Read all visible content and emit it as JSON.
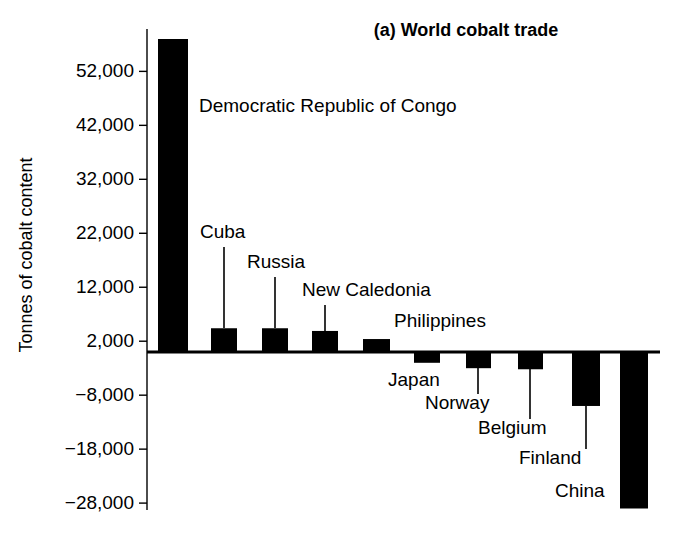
{
  "chart_data": {
    "type": "bar",
    "title": "(a) World cobalt trade",
    "xlabel": "",
    "ylabel": "Tonnes of cobalt content",
    "categories": [
      "Democratic Republic of Congo",
      "Cuba",
      "Russia",
      "New Caledonia",
      "Philippines",
      "Japan",
      "Norway",
      "Belgium",
      "Finland",
      "China"
    ],
    "values": [
      58000,
      4400,
      4400,
      3900,
      2400,
      -2000,
      -3000,
      -3200,
      -10000,
      -29000
    ],
    "ylim": [
      -28000,
      52000
    ],
    "ytick_values": [
      52000,
      42000,
      32000,
      22000,
      12000,
      2000,
      -8000,
      -18000,
      -28000
    ],
    "ytick_labels": [
      "52,000",
      "42,000",
      "32,000",
      "22,000",
      "12,000",
      "2,000",
      "−8,000",
      "−18,000",
      "−28,000"
    ],
    "grid": false,
    "legend": null,
    "bar_color": "#000000",
    "background_color": "#ffffff",
    "annotations": [
      {
        "text": "Democratic Republic of Congo",
        "category": "Democratic Republic of Congo",
        "leader": false
      },
      {
        "text": "Cuba",
        "category": "Cuba",
        "leader": true
      },
      {
        "text": "Russia",
        "category": "Russia",
        "leader": true
      },
      {
        "text": "New Caledonia",
        "category": "New Caledonia",
        "leader": true
      },
      {
        "text": "Philippines",
        "category": "Philippines",
        "leader": true
      },
      {
        "text": "Japan",
        "category": "Japan",
        "leader": false
      },
      {
        "text": "Norway",
        "category": "Norway",
        "leader": true
      },
      {
        "text": "Belgium",
        "category": "Belgium",
        "leader": true
      },
      {
        "text": "Finland",
        "category": "Finland",
        "leader": true
      },
      {
        "text": "China",
        "category": "China",
        "leader": false
      }
    ]
  },
  "geometry": {
    "axis_x": 147,
    "axis_top": 39,
    "axis_bottom": 510,
    "zero_y": 352,
    "px_per_unit": 0.005392,
    "plot_right": 660,
    "bars": [
      {
        "x": 158,
        "w": 30
      },
      {
        "x": 211,
        "w": 26
      },
      {
        "x": 262,
        "w": 26
      },
      {
        "x": 312,
        "w": 26
      },
      {
        "x": 363,
        "w": 27
      },
      {
        "x": 414,
        "w": 26
      },
      {
        "x": 466,
        "w": 25
      },
      {
        "x": 518,
        "w": 25
      },
      {
        "x": 572,
        "w": 28
      },
      {
        "x": 620,
        "w": 28
      }
    ],
    "labels": [
      {
        "x": 199,
        "y": 112,
        "anchor": "start",
        "leader_x": 0,
        "leader_y1": 0,
        "leader_y2": 0
      },
      {
        "x": 200,
        "y": 238,
        "anchor": "start",
        "leader_x": 224,
        "leader_y1": 247,
        "leader_y2": 328
      },
      {
        "x": 247,
        "y": 268,
        "anchor": "start",
        "leader_x": 275,
        "leader_y1": 277,
        "leader_y2": 328
      },
      {
        "x": 302,
        "y": 296,
        "anchor": "start",
        "leader_x": 325,
        "leader_y1": 305,
        "leader_y2": 331
      },
      {
        "x": 394,
        "y": 327,
        "anchor": "start",
        "leader_x": 0,
        "leader_y1": 0,
        "leader_y2": 0
      },
      {
        "x": 388,
        "y": 386,
        "anchor": "start",
        "leader_x": 0,
        "leader_y1": 0,
        "leader_y2": 0
      },
      {
        "x": 425,
        "y": 409,
        "anchor": "start",
        "leader_x": 478,
        "leader_y1": 368,
        "leader_y2": 394
      },
      {
        "x": 478,
        "y": 434,
        "anchor": "start",
        "leader_x": 530,
        "leader_y1": 369,
        "leader_y2": 419
      },
      {
        "x": 519,
        "y": 464,
        "anchor": "start",
        "leader_x": 586,
        "leader_y1": 406,
        "leader_y2": 449
      },
      {
        "x": 555,
        "y": 497,
        "anchor": "start",
        "leader_x": 0,
        "leader_y1": 0,
        "leader_y2": 0
      }
    ],
    "title_pos": {
      "x": 466,
      "y": 36
    },
    "ylabel_pos": {
      "x": 32,
      "y": 255
    }
  }
}
